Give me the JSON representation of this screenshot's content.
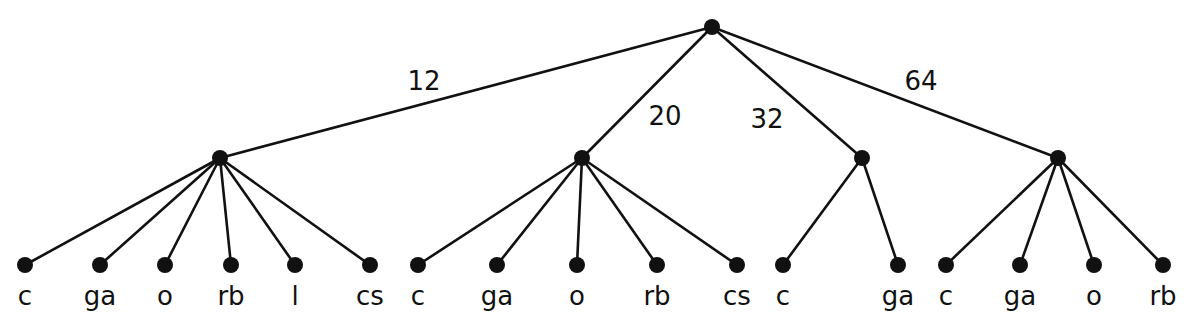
{
  "diagram": {
    "type": "tree",
    "root": {
      "x": 712,
      "y": 27
    },
    "groups": [
      {
        "edge_label": "12",
        "edge_label_pos": {
          "x": 424,
          "y": 90
        },
        "node": {
          "x": 220,
          "y": 158
        },
        "leaves": [
          {
            "label": "c",
            "x": 25
          },
          {
            "label": "ga",
            "x": 100
          },
          {
            "label": "o",
            "x": 165
          },
          {
            "label": "rb",
            "x": 231
          },
          {
            "label": "l",
            "x": 295
          },
          {
            "label": "cs",
            "x": 370
          }
        ]
      },
      {
        "edge_label": "20",
        "edge_label_pos": {
          "x": 665,
          "y": 125
        },
        "node": {
          "x": 582,
          "y": 158
        },
        "leaves": [
          {
            "label": "c",
            "x": 418
          },
          {
            "label": "ga",
            "x": 497
          },
          {
            "label": "o",
            "x": 577
          },
          {
            "label": "rb",
            "x": 657
          },
          {
            "label": "cs",
            "x": 737
          }
        ]
      },
      {
        "edge_label": "32",
        "edge_label_pos": {
          "x": 767,
          "y": 128
        },
        "node": {
          "x": 862,
          "y": 158
        },
        "leaves": [
          {
            "label": "c",
            "x": 783
          },
          {
            "label": "ga",
            "x": 898
          }
        ]
      },
      {
        "edge_label": "64",
        "edge_label_pos": {
          "x": 921,
          "y": 90
        },
        "node": {
          "x": 1058,
          "y": 158
        },
        "leaves": [
          {
            "label": "c",
            "x": 946
          },
          {
            "label": "ga",
            "x": 1020
          },
          {
            "label": "o",
            "x": 1094
          },
          {
            "label": "rb",
            "x": 1163
          }
        ]
      }
    ],
    "leaf_y": 265,
    "label_y": 305
  }
}
